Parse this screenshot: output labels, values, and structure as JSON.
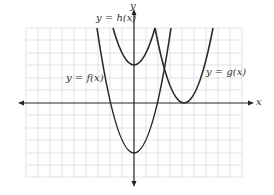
{
  "figure": {
    "axes": {
      "x_label": "x",
      "y_label": "y"
    },
    "curves": [
      {
        "id": "f",
        "label": "y = f(x)",
        "shape": "upward parabola",
        "vertex_note": "vertex below x-axis on the y-axis"
      },
      {
        "id": "g",
        "label": "y = g(x)",
        "shape": "upward parabola",
        "vertex_note": "vertex touching x-axis to the right of y-axis"
      },
      {
        "id": "h",
        "label": "y = h(x)",
        "shape": "upward parabola",
        "vertex_note": "vertex above x-axis on the y-axis"
      }
    ],
    "colors": {
      "grid": "#dcdcdc",
      "axis": "#222222",
      "curve": "#2a2a2a",
      "text": "#333333"
    }
  }
}
